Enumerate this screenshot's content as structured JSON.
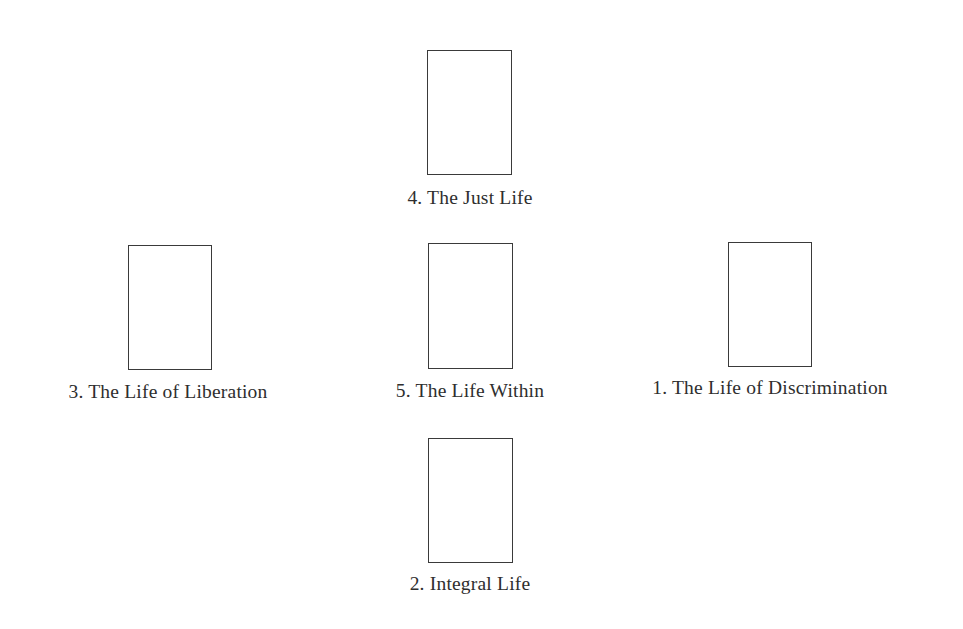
{
  "diagram": {
    "type": "card-spread",
    "layout": "cross",
    "positions": [
      {
        "number": 4,
        "label": "4. The Just Life",
        "position": "top",
        "box": {
          "x": 427,
          "y": 50,
          "w": 85,
          "h": 125
        },
        "label_center_x": 470,
        "label_top": 188
      },
      {
        "number": 3,
        "label": "3. The Life of Liberation",
        "position": "left",
        "box": {
          "x": 128,
          "y": 245,
          "w": 84,
          "h": 125
        },
        "label_center_x": 168,
        "label_top": 382
      },
      {
        "number": 5,
        "label": "5. The Life Within",
        "position": "center",
        "box": {
          "x": 428,
          "y": 243,
          "w": 85,
          "h": 126
        },
        "label_center_x": 470,
        "label_top": 381
      },
      {
        "number": 1,
        "label": "1. The Life of Discrimination",
        "position": "right",
        "box": {
          "x": 728,
          "y": 242,
          "w": 84,
          "h": 125
        },
        "label_center_x": 770,
        "label_top": 378
      },
      {
        "number": 2,
        "label": "2. Integral Life",
        "position": "bottom",
        "box": {
          "x": 428,
          "y": 438,
          "w": 85,
          "h": 125
        },
        "label_center_x": 470,
        "label_top": 574
      }
    ]
  }
}
